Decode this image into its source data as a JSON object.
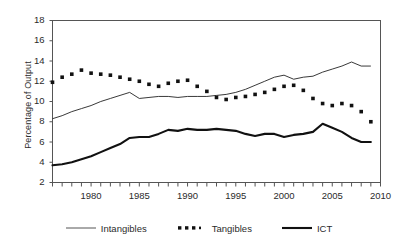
{
  "chart_data": {
    "type": "line",
    "title": "",
    "xlabel": "",
    "ylabel": "Percentage of Output",
    "xlim": [
      1976,
      2010
    ],
    "ylim": [
      2,
      18
    ],
    "ytick_values": [
      2,
      4,
      6,
      8,
      10,
      12,
      14,
      16,
      18
    ],
    "ytick_labels": [
      "2",
      "4",
      "6",
      "8",
      "10",
      "12",
      "14",
      "16",
      "18"
    ],
    "xtick_values": [
      1980,
      1985,
      1990,
      1995,
      2000,
      2005,
      2010
    ],
    "xtick_labels": [
      "1980",
      "1985",
      "1990",
      "1995",
      "2000",
      "2005",
      "2010"
    ],
    "xtick_minor_step": 1,
    "grid": false,
    "legend_position": "bottom",
    "x": [
      1976,
      1977,
      1978,
      1979,
      1980,
      1981,
      1982,
      1983,
      1984,
      1985,
      1986,
      1987,
      1988,
      1989,
      1990,
      1991,
      1992,
      1993,
      1994,
      1995,
      1996,
      1997,
      1998,
      1999,
      2000,
      2001,
      2002,
      2003,
      2004,
      2005,
      2006,
      2007,
      2008,
      2009
    ],
    "series": [
      {
        "name": "Intangibles",
        "style": "thin-line",
        "color": "#222222",
        "values": [
          8.3,
          8.6,
          9.0,
          9.3,
          9.6,
          10.0,
          10.3,
          10.6,
          10.9,
          10.3,
          10.4,
          10.5,
          10.5,
          10.4,
          10.5,
          10.5,
          10.5,
          10.6,
          10.7,
          10.9,
          11.2,
          11.6,
          12.0,
          12.4,
          12.6,
          12.2,
          12.4,
          12.5,
          12.9,
          13.2,
          13.5,
          13.9,
          13.5,
          13.5
        ]
      },
      {
        "name": "Tangibles",
        "style": "square-markers",
        "color": "#111111",
        "values": [
          11.9,
          12.4,
          12.7,
          13.1,
          12.8,
          12.7,
          12.6,
          12.4,
          12.2,
          12.0,
          11.7,
          11.5,
          11.8,
          12.0,
          12.1,
          11.5,
          11.0,
          10.4,
          10.2,
          10.4,
          10.5,
          10.7,
          10.9,
          11.2,
          11.5,
          11.6,
          11.1,
          10.3,
          9.8,
          9.6,
          9.8,
          9.6,
          9.0,
          8.0
        ]
      },
      {
        "name": "ICT",
        "style": "thick-line",
        "color": "#111111",
        "values": [
          3.7,
          3.8,
          4.0,
          4.3,
          4.6,
          5.0,
          5.4,
          5.8,
          6.4,
          6.5,
          6.5,
          6.8,
          7.2,
          7.1,
          7.3,
          7.2,
          7.2,
          7.3,
          7.2,
          7.1,
          6.8,
          6.6,
          6.8,
          6.8,
          6.5,
          6.7,
          6.8,
          7.0,
          7.8,
          7.4,
          7.0,
          6.4,
          6.0,
          6.0
        ]
      }
    ]
  },
  "legend": {
    "entries": [
      {
        "label": "Intangibles",
        "marker": "thin-line-swatch"
      },
      {
        "label": "Tangibles",
        "marker": "dotted-square-swatch"
      },
      {
        "label": "ICT",
        "marker": "thick-line-swatch"
      }
    ]
  }
}
